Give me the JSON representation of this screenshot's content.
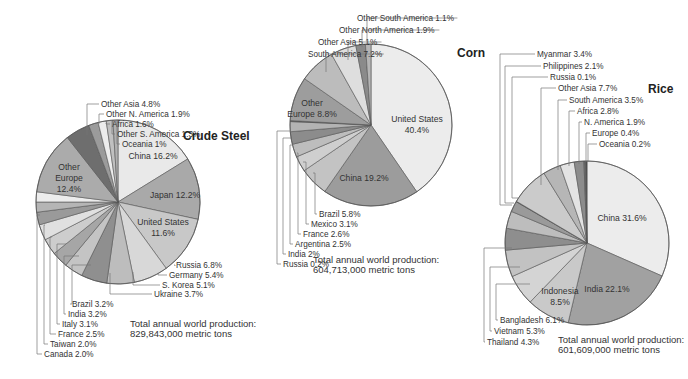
{
  "chart_data": [
    {
      "type": "pie",
      "title": "Crude Steel",
      "total_label": "Total annual world production:",
      "total_value": "829,843,000 metric tons",
      "geometry": {
        "cx": 118,
        "cy": 202,
        "r": 82,
        "start_deg": 0
      },
      "slices": [
        {
          "label": "China 16.2%",
          "value": 16.2,
          "color": "#e9e9e9",
          "inside": true
        },
        {
          "label": "Japan 12.2%",
          "value": 12.2,
          "color": "#a9a9a9",
          "inside": true
        },
        {
          "label": "United States 11.6%",
          "value": 11.6,
          "color": "#c8c8c8",
          "inside": true
        },
        {
          "label": "Russia 6.8%",
          "value": 6.8,
          "color": "#d8d8d8"
        },
        {
          "label": "Germany 5.4%",
          "value": 5.4,
          "color": "#bdbdbd"
        },
        {
          "label": "S. Korea 5.1%",
          "value": 5.1,
          "color": "#8f8f8f"
        },
        {
          "label": "Ukraine 3.7%",
          "value": 3.7,
          "color": "#c4c4c4"
        },
        {
          "label": "Brazil 3.2%",
          "value": 3.2,
          "color": "#a6a6a6"
        },
        {
          "label": "India 3.2%",
          "value": 3.2,
          "color": "#cdcdcd"
        },
        {
          "label": "Italy 3.1%",
          "value": 3.1,
          "color": "#e0e0e0"
        },
        {
          "label": "France 2.5%",
          "value": 2.5,
          "color": "#9a9a9a"
        },
        {
          "label": "Taiwan 2.0%",
          "value": 2.0,
          "color": "#b5b5b5"
        },
        {
          "label": "Canada 2.0%",
          "value": 2.0,
          "color": "#ececec"
        },
        {
          "label": "Other Europe 12.4%",
          "value": 12.4,
          "color": "#ababab",
          "inside": true
        },
        {
          "label": "Other Asia 4.8%",
          "value": 4.8,
          "color": "#6e6e6e"
        },
        {
          "label": "Other N. America 1.9%",
          "value": 1.9,
          "color": "#9b9b9b"
        },
        {
          "label": "Africa 1.6%",
          "value": 1.6,
          "color": "#ededed"
        },
        {
          "label": "Other S. America 1.3%",
          "value": 1.3,
          "color": "#c0c0c0"
        },
        {
          "label": "Oceania 1%",
          "value": 1.0,
          "color": "#b0b0b0"
        }
      ]
    },
    {
      "type": "pie",
      "title": "Corn",
      "total_label": "Total annual world production:",
      "total_value": "604,713,000 metric tons",
      "geometry": {
        "cx": 371,
        "cy": 125,
        "r": 81,
        "start_deg": 0
      },
      "slices": [
        {
          "label": "United States 40.4%",
          "value": 40.4,
          "color": "#ececec",
          "inside": true
        },
        {
          "label": "China 19.2%",
          "value": 19.2,
          "color": "#9c9c9c",
          "inside": true
        },
        {
          "label": "Brazil 5.8%",
          "value": 5.8,
          "color": "#c3c3c3"
        },
        {
          "label": "Mexico 3.1%",
          "value": 3.1,
          "color": "#cfcfcf"
        },
        {
          "label": "France 2.6%",
          "value": 2.6,
          "color": "#bdbdbd"
        },
        {
          "label": "Argentina 2.5%",
          "value": 2.5,
          "color": "#8c8c8c"
        },
        {
          "label": "India 2%",
          "value": 2.0,
          "color": "#b3b3b3"
        },
        {
          "label": "Russia 0.2%",
          "value": 0.2,
          "color": "#555555"
        },
        {
          "label": "Other Europe 8.8%",
          "value": 8.8,
          "color": "#9d9d9d",
          "inside": true
        },
        {
          "label": "South America 7.2%",
          "value": 7.2,
          "color": "#bcbcbc"
        },
        {
          "label": "Other Asia 5.1%",
          "value": 5.1,
          "color": "#dedede"
        },
        {
          "label": "Other North America 1.9%",
          "value": 1.9,
          "color": "#8a8a8a"
        },
        {
          "label": "Other South America 1.1%",
          "value": 1.1,
          "color": "#b5b5b5"
        }
      ]
    },
    {
      "type": "pie",
      "title": "Rice",
      "total_label": "Total annual world production:",
      "total_value": "601,609,000 metric tons",
      "geometry": {
        "cx": 587,
        "cy": 243,
        "r": 82,
        "start_deg": 0
      },
      "slices": [
        {
          "label": "China 31.6%",
          "value": 31.6,
          "color": "#ececec",
          "inside": true
        },
        {
          "label": "India 22.1%",
          "value": 22.1,
          "color": "#a1a1a1",
          "inside": true
        },
        {
          "label": "Indonesia 8.5%",
          "value": 8.5,
          "color": "#c9c9c9",
          "inside": true
        },
        {
          "label": "Bangladesh 6.1%",
          "value": 6.1,
          "color": "#d4d4d4"
        },
        {
          "label": "Vietnam 5.3%",
          "value": 5.3,
          "color": "#c2c2c2"
        },
        {
          "label": "Thailand 4.3%",
          "value": 4.3,
          "color": "#8e8e8e"
        },
        {
          "label": "Myanmar 3.4%",
          "value": 3.4,
          "color": "#bdbdbd"
        },
        {
          "label": "Philippines 2.1%",
          "value": 2.1,
          "color": "#9a9a9a"
        },
        {
          "label": "Russia 0.1%",
          "value": 0.1,
          "color": "#555555"
        },
        {
          "label": "Other Asia 7.7%",
          "value": 7.7,
          "color": "#cbcbcb"
        },
        {
          "label": "South America 3.5%",
          "value": 3.5,
          "color": "#b6b6b6"
        },
        {
          "label": "Africa 2.8%",
          "value": 2.8,
          "color": "#e3e3e3"
        },
        {
          "label": "N. America 1.9%",
          "value": 1.9,
          "color": "#8c8c8c"
        },
        {
          "label": "Europe 0.4%",
          "value": 0.4,
          "color": "#6a6a6a"
        },
        {
          "label": "Oceania 0.2%",
          "value": 0.2,
          "color": "#444444"
        }
      ]
    }
  ],
  "labels": {
    "steel": {
      "title_pos": [
        183,
        140
      ],
      "inside": [
        {
          "text": [
            "China 16.2%"
          ],
          "x": 153,
          "y": 159
        },
        {
          "text": [
            "Japan 12.2%"
          ],
          "x": 175,
          "y": 198
        },
        {
          "text": [
            "United States",
            "11.6%"
          ],
          "x": 163,
          "y": 225
        },
        {
          "text": [
            "Other",
            "Europe",
            "12.4%"
          ],
          "x": 69,
          "y": 170
        }
      ],
      "outside_right": [
        {
          "text": "Russia 6.8%",
          "anchor_x": 175,
          "anchor_y": 266,
          "x": 176,
          "y": 268
        },
        {
          "text": "Germany 5.4%",
          "anchor_x": 158,
          "anchor_y": 273,
          "x": 169,
          "y": 278
        },
        {
          "text": "S. Korea 5.1%",
          "anchor_x": 133,
          "anchor_y": 272,
          "x": 162,
          "y": 288
        },
        {
          "text": "Ukraine 3.7%",
          "anchor_x": 110,
          "anchor_y": 273,
          "x": 154,
          "y": 297
        }
      ],
      "outside_left": [
        {
          "text": "Brazil 3.2%",
          "anchor_x": 91,
          "anchor_y": 265,
          "x": 72,
          "y": 307
        },
        {
          "text": "India 3.2%",
          "anchor_x": 79,
          "anchor_y": 256,
          "x": 68,
          "y": 317
        },
        {
          "text": "Italy 3.1%",
          "anchor_x": 66,
          "anchor_y": 244,
          "x": 62,
          "y": 327
        },
        {
          "text": "France 2.5%",
          "anchor_x": 52,
          "anchor_y": 237,
          "x": 58,
          "y": 337
        },
        {
          "text": "Taiwan 2.0%",
          "anchor_x": 45,
          "anchor_y": 225,
          "x": 50,
          "y": 347
        },
        {
          "text": "Canada 2.0%",
          "anchor_x": 40,
          "anchor_y": 215,
          "x": 44,
          "y": 357
        }
      ],
      "outside_top": [
        {
          "text": "Other Asia 4.8%",
          "anchor_x": 87,
          "anchor_y": 135,
          "line_x": 87,
          "x": 101,
          "y": 107
        },
        {
          "text": "Other N. America 1.9%",
          "anchor_x": 99,
          "anchor_y": 124,
          "line_x": 99,
          "x": 106,
          "y": 117
        },
        {
          "text": "Africa 1.6%",
          "anchor_x": 106,
          "anchor_y": 123,
          "line_x": 106,
          "x": 112,
          "y": 127
        },
        {
          "text": "Other S. America 1.3%",
          "anchor_x": 112,
          "anchor_y": 121,
          "line_x": 112,
          "x": 117,
          "y": 137
        },
        {
          "text": "Oceania 1%",
          "anchor_x": 116,
          "anchor_y": 121,
          "line_x": 117,
          "x": 122,
          "y": 147
        }
      ],
      "total_pos": [
        130,
        327
      ]
    },
    "corn": {
      "title_pos": [
        457,
        57
      ],
      "inside": [
        {
          "text": [
            "United States",
            "40.4%"
          ],
          "x": 417,
          "y": 122
        },
        {
          "text": [
            "China 19.2%"
          ],
          "x": 364,
          "y": 181
        },
        {
          "text": [
            "Other",
            "Europe 8.8%"
          ],
          "x": 312,
          "y": 106
        }
      ],
      "outside_left": [
        {
          "text": "Brazil 5.8%",
          "anchor_x": 313,
          "anchor_y": 173,
          "x": 319,
          "y": 217
        },
        {
          "text": "Mexico 3.1%",
          "anchor_x": 303,
          "anchor_y": 162,
          "x": 311,
          "y": 227
        },
        {
          "text": "France 2.6%",
          "anchor_x": 297,
          "anchor_y": 153,
          "x": 303,
          "y": 237
        },
        {
          "text": "Argentina 2.5%",
          "anchor_x": 293,
          "anchor_y": 145,
          "x": 295,
          "y": 247
        },
        {
          "text": "India 2%",
          "anchor_x": 291,
          "anchor_y": 138,
          "x": 288,
          "y": 257
        },
        {
          "text": "Russia 0.2%",
          "anchor_x": 291,
          "anchor_y": 131,
          "x": 283,
          "y": 267
        }
      ],
      "outside_top": [
        {
          "text": "South America 7.2%",
          "x": 308,
          "y": 57,
          "ax": 326,
          "ay": 72
        },
        {
          "text": "Other Asia 5.1%",
          "x": 318,
          "y": 45,
          "ax": 348,
          "ay": 60
        },
        {
          "text": "Other North America 1.9%",
          "x": 339,
          "y": 33,
          "ax": 362,
          "ay": 47
        },
        {
          "text": "Other South America 1.1%",
          "x": 357,
          "y": 21,
          "ax": 367,
          "ay": 45
        }
      ],
      "total_pos": [
        313,
        263
      ]
    },
    "rice": {
      "title_pos": [
        648,
        93
      ],
      "inside": [
        {
          "text": [
            "China 31.6%"
          ],
          "x": 622,
          "y": 221
        },
        {
          "text": [
            "India 22.1%"
          ],
          "x": 607,
          "y": 292
        },
        {
          "text": [
            "Indonesia",
            "8.5%"
          ],
          "x": 560,
          "y": 294
        }
      ],
      "outside_top": [
        {
          "text": "Myanmar 3.4%",
          "line_x": 500,
          "anchor_x": 512,
          "anchor_y": 205,
          "x": 537,
          "y": 57
        },
        {
          "text": "Philippines 2.1%",
          "line_x": 505,
          "anchor_x": 514,
          "anchor_y": 203,
          "x": 543,
          "y": 69
        },
        {
          "text": "Russia 0.1%",
          "line_x": 512,
          "anchor_x": 518,
          "anchor_y": 198,
          "x": 550,
          "y": 80
        },
        {
          "text": "Other Asia 7.7%",
          "line_x": 541,
          "anchor_x": 541,
          "anchor_y": 185,
          "x": 558,
          "y": 91
        },
        {
          "text": "South America 3.5%",
          "line_x": 558,
          "anchor_x": 558,
          "anchor_y": 170,
          "x": 569,
          "y": 103
        },
        {
          "text": "Africa 2.8%",
          "line_x": 569,
          "anchor_x": 569,
          "anchor_y": 166,
          "x": 577,
          "y": 114
        },
        {
          "text": "N. America 1.9%",
          "line_x": 579,
          "anchor_x": 579,
          "anchor_y": 164,
          "x": 584,
          "y": 125
        },
        {
          "text": "Europe 0.4%",
          "line_x": 586,
          "anchor_x": 586,
          "anchor_y": 162,
          "x": 592,
          "y": 136
        },
        {
          "text": "Oceania 0.2%",
          "line_x": 588,
          "anchor_x": 588,
          "anchor_y": 162,
          "x": 599,
          "y": 147
        }
      ],
      "outside_bottom": [
        {
          "text": "Bangladesh 6.1%",
          "anchor_x": 530,
          "anchor_y": 284,
          "line_x": 496,
          "x": 500,
          "y": 323
        },
        {
          "text": "Vietnam 5.3%",
          "anchor_x": 520,
          "anchor_y": 267,
          "line_x": 490,
          "x": 494,
          "y": 334
        },
        {
          "text": "Thailand 4.3%",
          "anchor_x": 512,
          "anchor_y": 248,
          "line_x": 484,
          "x": 487,
          "y": 345
        }
      ],
      "total_pos": [
        558,
        343
      ]
    }
  }
}
